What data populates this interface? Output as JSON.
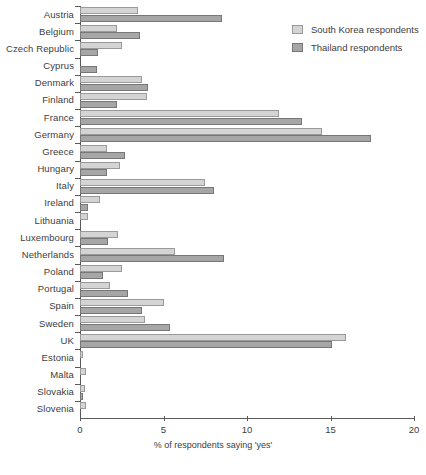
{
  "chart_data": {
    "type": "bar",
    "orientation": "horizontal",
    "title": "",
    "subtitle": "",
    "xlabel": "% of respondents saying 'yes'",
    "ylabel": "",
    "xlim": [
      0,
      20
    ],
    "xticks": [
      0,
      5,
      10,
      15,
      20
    ],
    "xtick_labels": [
      "0",
      "5",
      "10",
      "15",
      "20"
    ],
    "grid": false,
    "legend_position": "top-right",
    "categories": [
      "Austria",
      "Belgium",
      "Czech Republic",
      "Cyprus",
      "Denmark",
      "Finland",
      "France",
      "Germany",
      "Greece",
      "Hungary",
      "Italy",
      "Ireland",
      "Lithuania",
      "Luxembourg",
      "Netherlands",
      "Poland",
      "Portugal",
      "Spain",
      "Sweden",
      "UK",
      "Estonia",
      "Malta",
      "Slovakia",
      "Slovenia"
    ],
    "series": [
      {
        "name": "South Korea respondents",
        "color": "#d4d4d4",
        "values": [
          3.5,
          2.2,
          2.5,
          0.0,
          3.7,
          4.0,
          11.9,
          14.5,
          1.6,
          2.4,
          7.5,
          1.2,
          0.5,
          2.3,
          5.7,
          2.5,
          1.8,
          5.0,
          3.9,
          15.9,
          0.15,
          0.35,
          0.3,
          0.35
        ]
      },
      {
        "name": "Thailand respondents",
        "color": "#a6a6a6",
        "values": [
          8.5,
          3.6,
          1.1,
          1.0,
          4.1,
          2.2,
          13.3,
          17.4,
          2.7,
          1.6,
          8.0,
          0.5,
          0.0,
          1.7,
          8.6,
          1.4,
          2.9,
          3.7,
          5.4,
          15.1,
          0.0,
          0.0,
          0.15,
          0.0
        ]
      }
    ]
  },
  "legend": {
    "items": [
      {
        "label": "South Korea respondents",
        "swatch": "light"
      },
      {
        "label": "Thailand respondents",
        "swatch": "dark"
      }
    ]
  },
  "axis": {
    "x_title": "% of respondents saying 'yes'"
  }
}
